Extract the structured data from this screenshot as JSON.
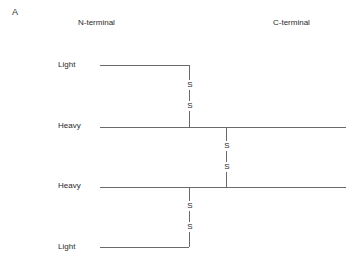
{
  "panel_label": "A",
  "headers": {
    "n_terminal": "N-terminal",
    "c_terminal": "C-terminal"
  },
  "chains": [
    {
      "label": "Light",
      "y": 65,
      "x_start": 100,
      "x_end": 189
    },
    {
      "label": "Heavy",
      "y": 127,
      "x_start": 100,
      "x_end": 346
    },
    {
      "label": "Heavy",
      "y": 187,
      "x_start": 100,
      "x_end": 346
    },
    {
      "label": "Light",
      "y": 247,
      "x_start": 100,
      "x_end": 189
    }
  ],
  "disulfide_bonds": [
    {
      "between": "Light-Heavy (top)",
      "x": 189,
      "y_top": 65,
      "y_bottom": 127,
      "labels": [
        "S",
        "S"
      ]
    },
    {
      "between": "Heavy-Heavy",
      "x": 226,
      "y_top": 127,
      "y_bottom": 187,
      "labels": [
        "S",
        "S"
      ]
    },
    {
      "between": "Heavy-Light (bottom)",
      "x": 189,
      "y_top": 187,
      "y_bottom": 247,
      "labels": [
        "S",
        "S"
      ]
    }
  ],
  "colors": {
    "line": "#6a6a6a",
    "text": "#2a2a2a",
    "background": "#ffffff"
  }
}
